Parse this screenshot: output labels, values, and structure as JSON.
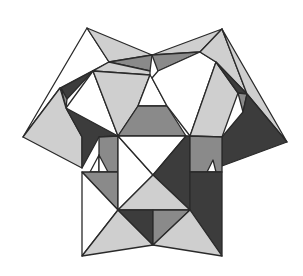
{
  "figure": {
    "colors": {
      "white": "#ffffff",
      "light": "#cfcfcf",
      "mid": "#8a8a8a",
      "dark": "#3c3c3c",
      "stroke": "#2a2a2a"
    },
    "faces": [
      {
        "name": "top-left-outer",
        "fill": "white",
        "points": "87,28 109,62 60,88 23,137"
      },
      {
        "name": "top-left-cap",
        "fill": "light",
        "points": "87,28 152,55 109,62"
      },
      {
        "name": "top-left-strip",
        "fill": "mid",
        "points": "109,62 152,55 150,71"
      },
      {
        "name": "top-left-strip2",
        "fill": "light",
        "points": "93,71 109,62 150,71 150,75"
      },
      {
        "name": "left-dark-tri",
        "fill": "dark",
        "points": "93,71 61,88 67,99"
      },
      {
        "name": "left-mid-tri",
        "fill": "mid",
        "points": "61,88 67,99 66,108"
      },
      {
        "name": "left-white-tri",
        "fill": "white",
        "points": "93,71 66,108 82,137 118,136"
      },
      {
        "name": "left-light-big",
        "fill": "light",
        "points": "93,71 150,75 138,106 118,136"
      },
      {
        "name": "top-center-white",
        "fill": "white",
        "points": "150,75 152,78 167,106 138,106"
      },
      {
        "name": "center-trap",
        "fill": "mid",
        "points": "138,106 167,106 186,136 118,136"
      },
      {
        "name": "top-right-cap",
        "fill": "light",
        "points": "222,29 152,55 200,52"
      },
      {
        "name": "top-right-strip",
        "fill": "mid",
        "points": "152,55 200,52 158,71"
      },
      {
        "name": "top-right-white",
        "fill": "white",
        "points": "158,71 200,52 216,62 190,136 167,106 152,78"
      },
      {
        "name": "right-light-big",
        "fill": "light",
        "points": "216,62 238,93 222,137 190,136"
      },
      {
        "name": "top-right-outer",
        "fill": "light",
        "points": "222,29 247,94 216,62 200,52"
      },
      {
        "name": "right-dark-sliver",
        "fill": "dark",
        "points": "216,62 247,94 238,93"
      },
      {
        "name": "right-mid-sliver",
        "fill": "mid",
        "points": "238,93 247,94 243,112"
      },
      {
        "name": "right-outer",
        "fill": "light",
        "points": "222,29 287,142 247,94"
      },
      {
        "name": "right-dark-big",
        "fill": "dark",
        "points": "247,94 287,142 222,166 222,137 243,112"
      },
      {
        "name": "left-outer-light",
        "fill": "light",
        "points": "23,137 60,88 66,108 82,137 82,168"
      },
      {
        "name": "left-dark-big",
        "fill": "dark",
        "points": "66,108 118,136 99,137 82,168 82,137"
      },
      {
        "name": "left-box-mid",
        "fill": "mid",
        "points": "99,137 118,136 118,172 99,172"
      },
      {
        "name": "left-box-white-small",
        "fill": "white",
        "points": "90,172 99,155 99,172"
      },
      {
        "name": "left-box-white-small2",
        "fill": "white",
        "points": "99,155 108,172 99,172"
      },
      {
        "name": "left-box-diag",
        "fill": "mid",
        "points": "82,172 118,172 118,210"
      },
      {
        "name": "left-box-white",
        "fill": "white",
        "points": "82,172 118,210 82,256"
      },
      {
        "name": "center-white",
        "fill": "white",
        "points": "118,136 153,175 118,210"
      },
      {
        "name": "center-white-2",
        "fill": "white",
        "points": "118,136 186,136 153,175"
      },
      {
        "name": "center-right-dark",
        "fill": "dark",
        "points": "186,136 190,136 190,210 153,175"
      },
      {
        "name": "right-box-mid",
        "fill": "mid",
        "points": "190,136 222,137 222,172 190,172"
      },
      {
        "name": "right-box-white-small",
        "fill": "white",
        "points": "207,172 213,160 216,172"
      },
      {
        "name": "right-box-dark",
        "fill": "dark",
        "points": "190,172 222,172 222,256 190,210"
      },
      {
        "name": "center-light",
        "fill": "light",
        "points": "118,210 153,175 190,210"
      },
      {
        "name": "lower-left-light",
        "fill": "light",
        "points": "82,256 118,210 153,245"
      },
      {
        "name": "lower-center-dark",
        "fill": "dark",
        "points": "118,210 153,210 153,245"
      },
      {
        "name": "lower-center-mid",
        "fill": "mid",
        "points": "153,210 190,210 153,245"
      },
      {
        "name": "lower-right-light",
        "fill": "light",
        "points": "153,245 190,210 222,256"
      }
    ]
  }
}
